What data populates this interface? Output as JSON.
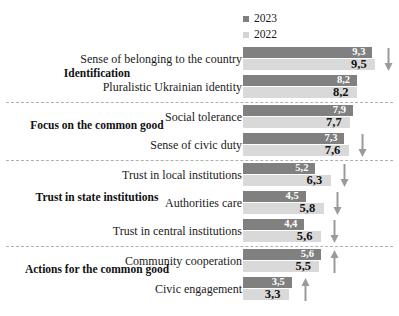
{
  "chart_data": {
    "type": "bar",
    "orientation": "horizontal",
    "title": "",
    "xlabel": "",
    "ylabel": "",
    "xlim": [
      0,
      10
    ],
    "grid": false,
    "legend_position": "top-right",
    "series": [
      {
        "name": "2023",
        "color": "#808080",
        "values": [
          9.3,
          8.2,
          7.9,
          7.3,
          5.2,
          4.5,
          4.4,
          5.6,
          3.5
        ]
      },
      {
        "name": "2022",
        "color": "#d9d9d9",
        "values": [
          9.5,
          8.2,
          7.7,
          7.6,
          6.3,
          5.8,
          5.6,
          5.5,
          3.3
        ]
      }
    ],
    "categories": [
      "Sense of belonging to the country",
      "Pluralistic Ukrainian identity",
      "Social tolerance",
      "Sense of civic duty",
      "Trust in local institutions",
      "Authorities care",
      "Trust in central institutions",
      "Community cooperation",
      "Civic engagement"
    ],
    "value_labels_2023": [
      "9,3",
      "8,2",
      "7,9",
      "7,3",
      "5,2",
      "4,5",
      "4,4",
      "5,6",
      "3,5"
    ],
    "value_labels_2022": [
      "9,5",
      "8,2",
      "7,7",
      "7,6",
      "6,3",
      "5,8",
      "5,6",
      "5,5",
      "3,3"
    ],
    "trend_annotations": [
      "down",
      "none",
      "none",
      "down",
      "down",
      "down",
      "down",
      "up",
      "up"
    ],
    "group_labels": [
      "Identification",
      "Focus on the common good",
      "Trust in state institutions",
      "Actions for the common good"
    ]
  },
  "legend": {
    "items": [
      {
        "label": "2023",
        "color": "#808080"
      },
      {
        "label": "2022",
        "color": "#d4d4d4"
      }
    ]
  },
  "groups": [
    {
      "title": "Identification",
      "rows": [
        {
          "label": "Sense of belonging to the country",
          "v2023": "9,3",
          "v2022": "9,5",
          "n2023": 9.3,
          "n2022": 9.5,
          "trend": "down"
        },
        {
          "label": "Pluralistic Ukrainian identity",
          "v2023": "8,2",
          "v2022": "8,2",
          "n2023": 8.2,
          "n2022": 8.2,
          "trend": "none"
        }
      ]
    },
    {
      "title": "Focus on the common good",
      "rows": [
        {
          "label": "Social tolerance",
          "v2023": "7,9",
          "v2022": "7,7",
          "n2023": 7.9,
          "n2022": 7.7,
          "trend": "none"
        },
        {
          "label": "Sense of civic duty",
          "v2023": "7,3",
          "v2022": "7,6",
          "n2023": 7.3,
          "n2022": 7.6,
          "trend": "down"
        }
      ]
    },
    {
      "title": "Trust in state institutions",
      "rows": [
        {
          "label": "Trust in local institutions",
          "v2023": "5,2",
          "v2022": "6,3",
          "n2023": 5.2,
          "n2022": 6.3,
          "trend": "down"
        },
        {
          "label": "Authorities care",
          "v2023": "4,5",
          "v2022": "5,8",
          "n2023": 4.5,
          "n2022": 5.8,
          "trend": "down"
        },
        {
          "label": "Trust in central institutions",
          "v2023": "4,4",
          "v2022": "5,6",
          "n2023": 4.4,
          "n2022": 5.6,
          "trend": "down"
        }
      ]
    },
    {
      "title": "Actions for the common good",
      "rows": [
        {
          "label": "Community cooperation",
          "v2023": "5,6",
          "v2022": "5,5",
          "n2023": 5.6,
          "n2022": 5.5,
          "trend": "up"
        },
        {
          "label": "Civic engagement",
          "v2023": "3,5",
          "v2022": "3,3",
          "n2023": 3.5,
          "n2022": 3.3,
          "trend": "up"
        }
      ]
    }
  ],
  "colors": {
    "series_2023": "#808080",
    "series_2022": "#d9d9d9",
    "divider": "#b0b0b0",
    "arrow": "#9a9a9a",
    "text": "#1a1a1a"
  }
}
